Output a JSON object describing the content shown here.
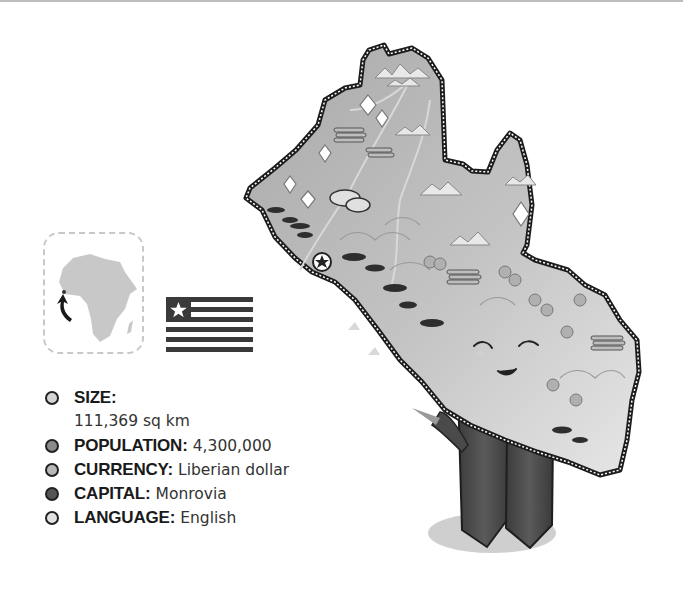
{
  "country": "Liberia",
  "locator_map": {
    "region": "Africa",
    "icon": "arrow-pointer-icon"
  },
  "flag": {
    "name": "Liberian flag",
    "stripes": 11,
    "canton_color": "#3a3a3a",
    "stripe_color": "#3a3a3a"
  },
  "facts": [
    {
      "label": "SIZE:",
      "value": "111,369 sq km",
      "dot_color": "#d4d4d4"
    },
    {
      "label": "POPULATION:",
      "value": "4,300,000",
      "dot_color": "#8a8a8a"
    },
    {
      "label": "CURRENCY:",
      "value": "Liberian dollar",
      "dot_color": "#b8b8b8"
    },
    {
      "label": "CAPITAL:",
      "value": "Monrovia",
      "dot_color": "#555555"
    },
    {
      "label": "LANGUAGE:",
      "value": "English",
      "dot_color": "#e2e2e2"
    }
  ],
  "map": {
    "capital_marker": "star-icon",
    "features": [
      "mountains",
      "diamonds",
      "timber-logs",
      "gold-nuggets",
      "trees",
      "hills",
      "rivers",
      "fish-boats"
    ],
    "mascot": "smiling-face"
  }
}
